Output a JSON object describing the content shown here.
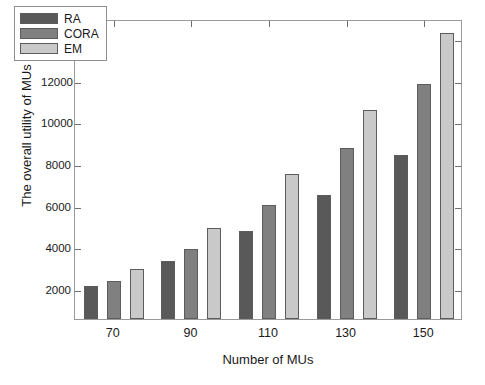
{
  "chart_data": {
    "type": "bar",
    "title": "",
    "xlabel": "Number of MUs",
    "ylabel": "The overall utility of MUs",
    "categories": [
      "70",
      "90",
      "110",
      "130",
      "150"
    ],
    "series": [
      {
        "name": "RA",
        "color": "#595959",
        "values": [
          2150,
          3350,
          4800,
          6500,
          8450
        ]
      },
      {
        "name": "CORA",
        "color": "#808080",
        "values": [
          2400,
          3950,
          6050,
          8750,
          11850
        ]
      },
      {
        "name": "EM",
        "color": "#c9c9c9",
        "values": [
          2950,
          4950,
          7500,
          10600,
          14300
        ]
      }
    ],
    "yticks": [
      2000,
      4000,
      6000,
      8000,
      10000,
      12000,
      14000
    ],
    "ytick_labels": [
      "2000",
      "4000",
      "6000",
      "8000",
      "10000",
      "12000",
      "14000"
    ],
    "ylim": [
      570,
      14950
    ],
    "xtick_labels": [
      "70",
      "90",
      "110",
      "130",
      "150"
    ],
    "grid": false,
    "legend_position": "upper-left",
    "legend_entries": [
      "RA",
      "CORA",
      "EM"
    ]
  }
}
